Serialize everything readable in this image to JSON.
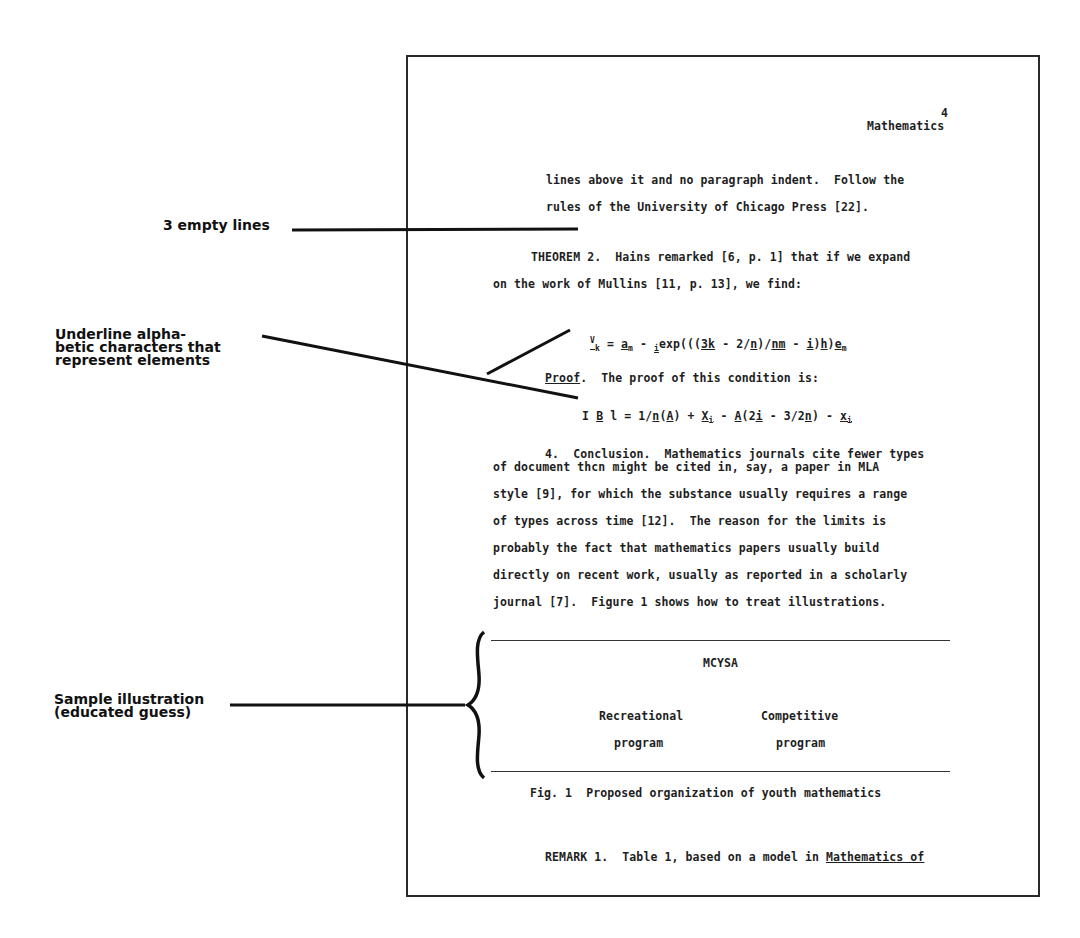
{
  "page": {
    "page_number": "4",
    "running_head": "Mathematics",
    "para1": {
      "line1": "lines above it and no paragraph indent.  Follow the",
      "line2": "rules of the University of Chicago Press [22]."
    },
    "theorem": {
      "line1": "THEOREM 2.  Hains remarked [6, p. 1] that if we expand",
      "line2": "on the work of Mullins [11, p. 13], we find:"
    },
    "equation1": {
      "lhs": "V",
      "lhs_sub": "k",
      "eq": " = ",
      "a": "a",
      "a_sub": "m",
      "minus": " - ",
      "i_pre": "i",
      "body1": "exp(((",
      "three_k": "3k",
      "body2": " - 2/",
      "n": "n",
      "slash": ")/",
      "nm": "nm",
      "body3": " - ",
      "i2": "i",
      "paren": ")",
      "h": "h",
      "paren2": ")",
      "e": "e",
      "e_sub": "m"
    },
    "proof": {
      "label": "Proof",
      "text": ".  The proof of this condition is:"
    },
    "equation2": {
      "i": "I",
      "b": "B",
      "l": "l",
      "eq": " = 1/",
      "n": "n",
      "open": "(",
      "A": "A",
      "close": ") + ",
      "X": "X",
      "X_sub": "i",
      "minus": " - ",
      "A2": "A",
      "p1": "(2",
      "i2": "i",
      "p2": " - 3/2",
      "n2": "n",
      "p3": ") - ",
      "x": "x",
      "x_sub": "i"
    },
    "conclusion": {
      "heading_num": "4.",
      "heading": "Conclusion.",
      "line1_rest": "  Mathematics journals cite fewer types",
      "line2": "of document thcn might be cited in, say, a paper in MLA",
      "line3": "style [9], for which the substance usually requires a range",
      "line4": "of types across time [12].  The reason for the limits is",
      "line5": "probably the fact that mathematics papers usually build",
      "line6": "directly on recent work, usually as reported in a scholarly",
      "line7": "journal [7].  Figure 1 shows how to treat illustrations."
    },
    "figure": {
      "top_label": "MCYSA",
      "left_line1": "Recreational",
      "left_line2": "program",
      "right_line1": "Competitive",
      "right_line2": "program",
      "caption": "Fig. 1  Proposed organization of youth mathematics"
    },
    "remark": {
      "text": "REMARK 1.  Table 1, based on a model in ",
      "underlined": "Mathematics of"
    }
  },
  "annotations": {
    "empty_lines": "3 empty lines",
    "underline": "Underline alpha-\nbetic characters that\nrepresent elements",
    "illustration": "Sample illustration\n(educated guess)"
  },
  "colors": {
    "ink": "#1e1e1e",
    "border": "#2a2a2a",
    "background": "#ffffff"
  }
}
